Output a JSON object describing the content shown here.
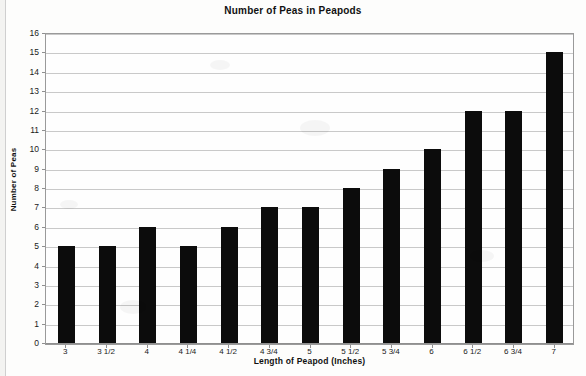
{
  "chart_data": {
    "type": "bar",
    "title": "Number of Peas in Peapods",
    "xlabel": "Length of Peapod (Inches)",
    "ylabel": "Number of Peas",
    "categories": [
      "3",
      "3 1/2",
      "4",
      "4 1/4",
      "4 1/2",
      "4 3/4",
      "5",
      "5 1/2",
      "5 3/4",
      "6",
      "6 1/2",
      "6 3/4",
      "7"
    ],
    "values": [
      5,
      5,
      6,
      5,
      6,
      7,
      7,
      8,
      9,
      10,
      12,
      12,
      15
    ],
    "ylim": [
      0,
      16
    ],
    "ytick_step": 1,
    "yticks": [
      0,
      1,
      2,
      3,
      4,
      5,
      6,
      7,
      8,
      9,
      10,
      11,
      12,
      13,
      14,
      15,
      16
    ],
    "grid": true,
    "legend": false,
    "bar_color": "#0c0c0c",
    "grid_color": "#c9c9c9",
    "plot_border_color": "#9a9a9a",
    "background_color": "#fdfdfc"
  }
}
